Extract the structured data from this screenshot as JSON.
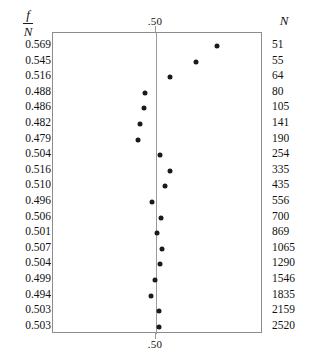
{
  "figure": {
    "headers": {
      "left_numerator": "f",
      "left_denominator": "N",
      "right": "N"
    },
    "axis_top_label": ".50",
    "axis_bottom_label": ".50"
  },
  "chart_data": {
    "type": "scatter",
    "title": "",
    "subtitle": "",
    "xlabel": "",
    "ylabel": "",
    "orientation": "horizontal-dot-plot",
    "grid": false,
    "legend": null,
    "reference_line": 0.5,
    "reference_line_label": ".50",
    "xlim": [
      0.455,
      0.585
    ],
    "x_tick_labels": [
      ".50"
    ],
    "categories": [
      51,
      55,
      64,
      80,
      105,
      141,
      190,
      254,
      335,
      435,
      556,
      700,
      869,
      1065,
      1290,
      1546,
      1835,
      2159,
      2520
    ],
    "values": [
      0.569,
      0.545,
      0.516,
      0.488,
      0.486,
      0.482,
      0.479,
      0.504,
      0.516,
      0.51,
      0.496,
      0.506,
      0.501,
      0.507,
      0.504,
      0.499,
      0.494,
      0.503,
      0.503
    ],
    "series": [
      {
        "name": "f/N",
        "values": [
          0.569,
          0.545,
          0.516,
          0.488,
          0.486,
          0.482,
          0.479,
          0.504,
          0.516,
          0.51,
          0.496,
          0.506,
          0.501,
          0.507,
          0.504,
          0.499,
          0.494,
          0.503,
          0.503
        ]
      }
    ],
    "rows": [
      {
        "f_over_n": "0.569",
        "n": "51",
        "value": 0.569
      },
      {
        "f_over_n": "0.545",
        "n": "55",
        "value": 0.545
      },
      {
        "f_over_n": "0.516",
        "n": "64",
        "value": 0.516
      },
      {
        "f_over_n": "0.488",
        "n": "80",
        "value": 0.488
      },
      {
        "f_over_n": "0.486",
        "n": "105",
        "value": 0.486
      },
      {
        "f_over_n": "0.482",
        "n": "141",
        "value": 0.482
      },
      {
        "f_over_n": "0.479",
        "n": "190",
        "value": 0.479
      },
      {
        "f_over_n": "0.504",
        "n": "254",
        "value": 0.504
      },
      {
        "f_over_n": "0.516",
        "n": "335",
        "value": 0.516
      },
      {
        "f_over_n": "0.510",
        "n": "435",
        "value": 0.51
      },
      {
        "f_over_n": "0.496",
        "n": "556",
        "value": 0.496
      },
      {
        "f_over_n": "0.506",
        "n": "700",
        "value": 0.506
      },
      {
        "f_over_n": "0.501",
        "n": "869",
        "value": 0.501
      },
      {
        "f_over_n": "0.507",
        "n": "1065",
        "value": 0.507
      },
      {
        "f_over_n": "0.504",
        "n": "1290",
        "value": 0.504
      },
      {
        "f_over_n": "0.499",
        "n": "1546",
        "value": 0.499
      },
      {
        "f_over_n": "0.494",
        "n": "1835",
        "value": 0.494
      },
      {
        "f_over_n": "0.503",
        "n": "2159",
        "value": 0.503
      },
      {
        "f_over_n": "0.503",
        "n": "2520",
        "value": 0.503
      }
    ]
  },
  "colors": {
    "dot": "#1a1a1a",
    "frame": "#8c8c8c",
    "reference_line": "#9a9a9a",
    "text": "#111111",
    "background": "#ffffff"
  }
}
